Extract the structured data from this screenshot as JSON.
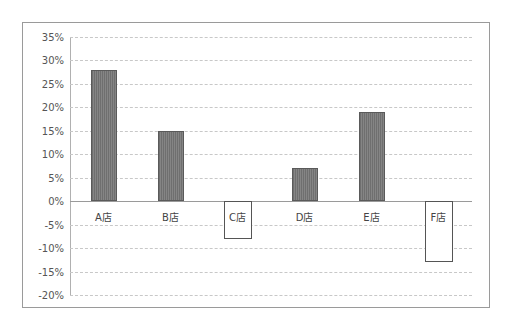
{
  "chart_data": {
    "type": "bar",
    "title": "",
    "xlabel": "",
    "ylabel": "",
    "categories": [
      "A店",
      "B店",
      "C店",
      "D店",
      "E店",
      "F店"
    ],
    "values": [
      0.28,
      0.15,
      -0.08,
      0.07,
      0.19,
      -0.13
    ],
    "value_labels": [
      "28%",
      "15%",
      "-8%",
      "7%",
      "19%",
      "-13%"
    ],
    "ylim": [
      -0.2,
      0.35
    ],
    "yticks": [
      "35%",
      "30%",
      "25%",
      "20%",
      "15%",
      "10%",
      "5%",
      "0%",
      "-5%",
      "-10%",
      "-15%",
      "-20%"
    ],
    "grid": true,
    "legend": "none",
    "colors": {
      "positive_fill": "#7a7a7a",
      "negative_fill": "#ffffff",
      "negative_border": "#555555"
    }
  }
}
